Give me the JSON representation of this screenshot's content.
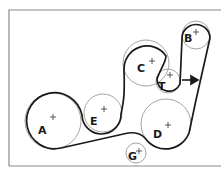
{
  "diagram": {
    "type": "serpentine-belt-routing",
    "colors": {
      "belt": "#1a1a1a",
      "pulley": "#9a9a9a",
      "frame": "#8a8a8a"
    },
    "pulleys": [
      {
        "id": "A",
        "label": "A"
      },
      {
        "id": "B",
        "label": "B"
      },
      {
        "id": "C",
        "label": "C"
      },
      {
        "id": "D",
        "label": "D"
      },
      {
        "id": "E",
        "label": "E"
      },
      {
        "id": "G",
        "label": "G"
      },
      {
        "id": "T",
        "label": "T"
      }
    ],
    "arrow": {
      "direction": "right",
      "meaning": "tensioner direction"
    }
  }
}
